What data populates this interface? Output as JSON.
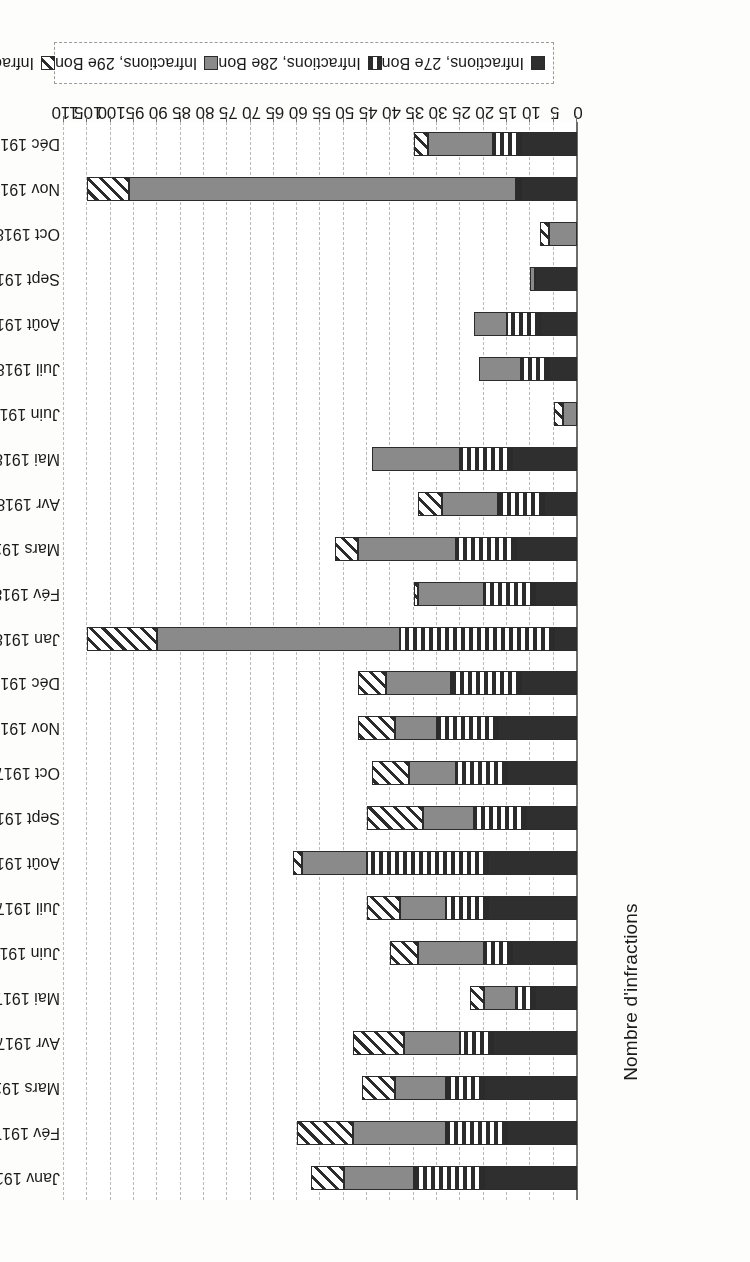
{
  "chart_data": {
    "type": "bar",
    "orientation": "horizontal",
    "stacked": true,
    "title": "",
    "xlabel": "",
    "ylabel": "Nombre d'infractions",
    "ylim": [
      0,
      110
    ],
    "tick_step": 5,
    "grid": true,
    "legend_position": "bottom",
    "axis_ticks": [
      0,
      5,
      10,
      15,
      20,
      25,
      30,
      35,
      40,
      45,
      50,
      55,
      60,
      65,
      70,
      75,
      80,
      85,
      90,
      95,
      100,
      105,
      110
    ],
    "categories": [
      "Janv 1917",
      "Fév 1917",
      "Mars 1917",
      "Avr 1917",
      "Mai 1917",
      "Juin 1917",
      "Juil 1917",
      "Août 1917",
      "Sept 1917",
      "Oct 1917",
      "Nov 1917",
      "Déc 1917",
      "Jan 1918",
      "Fév 1918",
      "Mars 1918",
      "Avr 1918",
      "Mai 1918",
      "Juin 1918",
      "Juil 1918",
      "Août 1918",
      "Sept 1918",
      "Oct 1918",
      "Nov 1918",
      "Déc 1918"
    ],
    "series": [
      {
        "name": "Infractions, 27e Bon",
        "pattern": "solid-dark",
        "color": "#2f2f2f",
        "values": [
          20,
          15,
          20,
          18,
          9,
          14,
          19,
          19,
          11,
          15,
          17,
          12,
          5,
          9,
          13,
          7,
          14,
          0,
          6,
          8,
          9,
          0,
          12,
          12
        ]
      },
      {
        "name": "Infractions, 28e Bon",
        "pattern": "vertical-stripes",
        "color": "#2b2b2b",
        "values": [
          15,
          13,
          8,
          7,
          4,
          6,
          9,
          26,
          11,
          11,
          13,
          15,
          33,
          11,
          13,
          10,
          11,
          0,
          6,
          7,
          0,
          0,
          1,
          6
        ]
      },
      {
        "name": "Infractions, 29e Bon",
        "pattern": "solid-grey",
        "color": "#8a8a8a",
        "values": [
          15,
          20,
          11,
          12,
          7,
          14,
          10,
          14,
          11,
          10,
          9,
          14,
          52,
          14,
          21,
          12,
          19,
          3,
          9,
          7,
          1,
          6,
          83,
          14
        ]
      },
      {
        "name": "Infractions, 31e Bon",
        "pattern": "diagonal-hatch",
        "color": "#2b2b2b",
        "values": [
          7,
          12,
          7,
          11,
          3,
          6,
          7,
          2,
          12,
          8,
          8,
          6,
          15,
          1,
          5,
          5,
          0,
          2,
          0,
          0,
          0,
          2,
          9,
          3
        ]
      }
    ]
  },
  "legend": {
    "items": [
      {
        "label": "Infractions, 27e Bon"
      },
      {
        "label": "Infractions, 28e Bon"
      },
      {
        "label": "Infractions, 29e Bon"
      },
      {
        "label": "Infractions, 31e Bon"
      }
    ]
  }
}
